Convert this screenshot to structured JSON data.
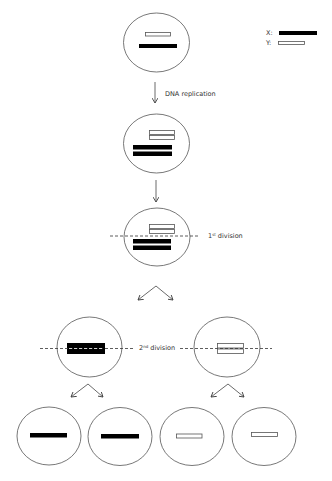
{
  "diagram": {
    "type": "meiosis-sex-chromosome-segregation",
    "legend": {
      "x_label": "X:",
      "y_label": "Y:",
      "x_style": "black filled bar",
      "y_style": "white outlined bar"
    },
    "steps": [
      {
        "id": "start",
        "description": "Cell with one X (black) and one Y (white) chromosome"
      },
      {
        "id": "replication",
        "label": "DNA replication"
      },
      {
        "id": "replicated",
        "description": "Cell with duplicated X and Y chromosomes"
      },
      {
        "id": "first-division",
        "label_num": "1",
        "label_sup": "st",
        "label_text": " division"
      },
      {
        "id": "second-division",
        "label_num": "2",
        "label_sup": "nd",
        "label_text": " division"
      },
      {
        "id": "gametes",
        "description": "Four gametes: two carrying X, two carrying Y"
      }
    ],
    "colors": {
      "stroke": "#555555",
      "x_fill": "#000000",
      "y_fill": "#ffffff",
      "text": "#333333"
    }
  }
}
